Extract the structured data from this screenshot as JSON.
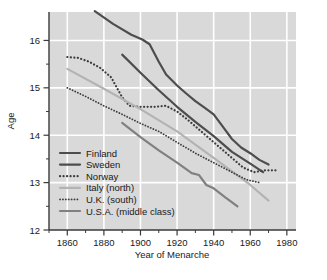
{
  "chart_data": {
    "type": "line",
    "title": "",
    "xlabel": "Year of Menarche",
    "ylabel": "Age",
    "xlim": [
      1850,
      1985
    ],
    "ylim": [
      12,
      16.6
    ],
    "xticks": [
      1860,
      1880,
      1900,
      1920,
      1940,
      1960,
      1980
    ],
    "xtick_labels": [
      "1860",
      "1880",
      "1900",
      "1920",
      "1940",
      "1960",
      "1980"
    ],
    "xminorticks": [
      1850,
      1870,
      1890,
      1910,
      1930,
      1950,
      1970
    ],
    "yticks": [
      12,
      13,
      14,
      15,
      16
    ],
    "ytick_labels": [
      "12",
      "13",
      "14",
      "15",
      "16"
    ],
    "yminorticks": [
      12.5,
      13.5,
      14.5,
      15.5
    ],
    "grid": true,
    "grid_color": "#ffffff",
    "plot_bg": "#d9d9d9",
    "legend_position": "lower-left-inside",
    "series": [
      {
        "name": "Finland",
        "style": "solid",
        "color": "#4d4d4d",
        "width": 2.2,
        "points": [
          [
            1875,
            16.62
          ],
          [
            1885,
            16.35
          ],
          [
            1895,
            16.12
          ],
          [
            1901,
            16.02
          ],
          [
            1905,
            15.92
          ],
          [
            1910,
            15.55
          ],
          [
            1914,
            15.28
          ],
          [
            1920,
            15.05
          ],
          [
            1925,
            14.88
          ],
          [
            1930,
            14.72
          ],
          [
            1935,
            14.58
          ],
          [
            1940,
            14.44
          ],
          [
            1945,
            14.18
          ],
          [
            1950,
            13.92
          ],
          [
            1955,
            13.74
          ],
          [
            1960,
            13.62
          ],
          [
            1965,
            13.48
          ],
          [
            1970,
            13.38
          ]
        ]
      },
      {
        "name": "Sweden",
        "style": "solid",
        "color": "#4d4d4d",
        "width": 2.2,
        "points": [
          [
            1890,
            15.7
          ],
          [
            1900,
            15.32
          ],
          [
            1910,
            14.95
          ],
          [
            1920,
            14.6
          ],
          [
            1930,
            14.28
          ],
          [
            1940,
            13.98
          ],
          [
            1950,
            13.65
          ],
          [
            1960,
            13.4
          ],
          [
            1967,
            13.22
          ]
        ]
      },
      {
        "name": "Norway",
        "style": "dotted",
        "color": "#3d3d3d",
        "width": 2.2,
        "points": [
          [
            1860,
            15.65
          ],
          [
            1866,
            15.63
          ],
          [
            1872,
            15.55
          ],
          [
            1878,
            15.42
          ],
          [
            1884,
            15.22
          ],
          [
            1890,
            14.8
          ],
          [
            1894,
            14.62
          ],
          [
            1900,
            14.6
          ],
          [
            1908,
            14.6
          ],
          [
            1914,
            14.62
          ],
          [
            1920,
            14.5
          ],
          [
            1926,
            14.32
          ],
          [
            1932,
            14.12
          ],
          [
            1938,
            13.92
          ],
          [
            1944,
            13.72
          ],
          [
            1950,
            13.52
          ],
          [
            1956,
            13.32
          ],
          [
            1962,
            13.22
          ],
          [
            1968,
            13.26
          ],
          [
            1975,
            13.26
          ]
        ]
      },
      {
        "name": "Italy (north)",
        "style": "solid",
        "color": "#b3b3b3",
        "width": 2.2,
        "points": [
          [
            1860,
            15.4
          ],
          [
            1880,
            14.98
          ],
          [
            1900,
            14.55
          ],
          [
            1920,
            14.08
          ],
          [
            1940,
            13.52
          ],
          [
            1960,
            12.95
          ],
          [
            1970,
            12.62
          ]
        ]
      },
      {
        "name": "U.K. (south)",
        "style": "dotted",
        "color": "#3d3d3d",
        "width": 1.8,
        "points": [
          [
            1860,
            15.0
          ],
          [
            1870,
            14.82
          ],
          [
            1880,
            14.62
          ],
          [
            1890,
            14.44
          ],
          [
            1900,
            14.25
          ],
          [
            1910,
            14.08
          ],
          [
            1920,
            13.85
          ],
          [
            1930,
            13.62
          ],
          [
            1940,
            13.42
          ],
          [
            1950,
            13.22
          ],
          [
            1958,
            13.06
          ],
          [
            1965,
            13.0
          ]
        ]
      },
      {
        "name": "U.S.A. (middle class)",
        "style": "solid",
        "color": "#808080",
        "width": 2.2,
        "points": [
          [
            1890,
            14.26
          ],
          [
            1900,
            13.96
          ],
          [
            1910,
            13.68
          ],
          [
            1920,
            13.42
          ],
          [
            1928,
            13.2
          ],
          [
            1932,
            13.16
          ],
          [
            1936,
            12.95
          ],
          [
            1940,
            12.88
          ],
          [
            1946,
            12.7
          ],
          [
            1953,
            12.5
          ]
        ]
      }
    ]
  },
  "legend": {
    "items": [
      {
        "label": "Finland"
      },
      {
        "label": "Sweden"
      },
      {
        "label": "Norway"
      },
      {
        "label": "Italy (north)"
      },
      {
        "label": "U.K. (south)"
      },
      {
        "label": "U.S.A. (middle class)"
      }
    ]
  }
}
